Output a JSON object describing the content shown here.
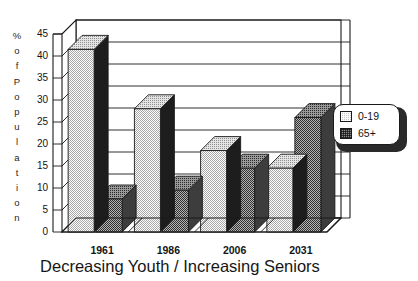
{
  "chart_data": {
    "type": "bar",
    "title": "",
    "xlabel": "Decreasing Youth / Increasing Seniors",
    "ylabel": "% of Population",
    "categories": [
      "1961",
      "1986",
      "2006",
      "2031"
    ],
    "series": [
      {
        "name": "0-19",
        "values": [
          41.5,
          28,
          18.5,
          14.5
        ],
        "fill": "light-dotted",
        "color": "#c9c9c9"
      },
      {
        "name": "65+",
        "values": [
          7.5,
          9.5,
          14.5,
          26
        ],
        "fill": "dark-checkered",
        "color": "#8a8a8a"
      }
    ],
    "ylim": [
      0,
      45
    ],
    "ytick_step": 5,
    "yticks": [
      "0",
      "5",
      "10",
      "15",
      "20",
      "25",
      "30",
      "35",
      "40",
      "45"
    ],
    "grid": true,
    "grid_axis": "y",
    "legend_position": "right",
    "style": "3d-bars",
    "background": "#ffffff",
    "line_color": "#1a1a1a"
  },
  "y_axis_title_chars": [
    "%",
    "o",
    "f",
    "P",
    "o",
    "p",
    "u",
    "l",
    "a",
    "t",
    "i",
    "o",
    "n"
  ],
  "legend": {
    "entries": [
      {
        "label": "0-19"
      },
      {
        "label": "65+"
      }
    ]
  }
}
